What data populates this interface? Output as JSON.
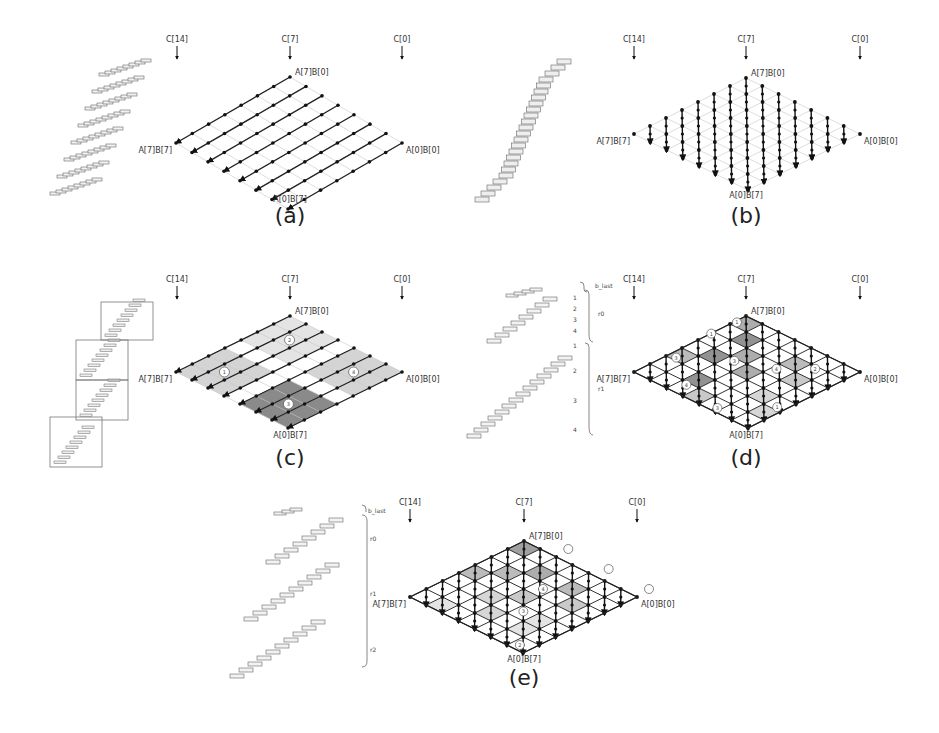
{
  "figure": {
    "panels": [
      {
        "id": "a",
        "caption": "(a)",
        "column_labels": [
          "C[14]",
          "C[7]",
          "C[0]"
        ],
        "corner_labels": {
          "top": "A[7]B[0]",
          "left": "A[7]B[7]",
          "right": "A[0]B[0]",
          "bottom": "A[0]B[7]"
        },
        "grid": {
          "top": [
            290,
            77
          ],
          "left": [
            176,
            143
          ],
          "right": [
            402,
            143
          ],
          "bottom": [
            290,
            192
          ]
        },
        "col_x": [
          177,
          290,
          402
        ],
        "col_y": 42,
        "flow": "row",
        "staircase": {
          "type": "rows",
          "x0": 50,
          "y0": 190,
          "rows": 8
        },
        "shaded": [],
        "circles": []
      },
      {
        "id": "b",
        "caption": "(b)",
        "column_labels": [
          "C[14]",
          "C[7]",
          "C[0]"
        ],
        "corner_labels": {
          "top": "A[7]B[0]",
          "left": "A[7]B[7]",
          "right": "A[0]B[0]",
          "bottom": "A[0]B[7]"
        },
        "grid": {
          "top": [
            746,
            78
          ],
          "left": [
            634,
            134
          ],
          "right": [
            860,
            134
          ],
          "bottom": [
            746,
            188
          ]
        },
        "col_x": [
          634,
          746,
          860
        ],
        "col_y": 42,
        "flow": "column",
        "staircase": {
          "type": "tower",
          "x0": 475,
          "y0": 197
        },
        "shaded": [],
        "circles": []
      },
      {
        "id": "c",
        "caption": "(c)",
        "column_labels": [
          "C[14]",
          "C[7]",
          "C[0]"
        ],
        "corner_labels": {
          "top": "A[7]B[0]",
          "left": "A[7]B[7]",
          "right": "A[0]B[0]",
          "bottom": "A[0]B[7]"
        },
        "grid": {
          "top": [
            290,
            316
          ],
          "left": [
            176,
            372
          ],
          "right": [
            402,
            372
          ],
          "bottom": [
            290,
            428
          ]
        },
        "col_x": [
          177,
          290,
          402
        ],
        "col_y": 282,
        "flow": "row-blocks",
        "staircase": {
          "type": "boxed",
          "boxes": 4
        },
        "shaded": [
          {
            "r0": 0,
            "r1": 3,
            "c0": 0,
            "c1": 3,
            "shade": "#e4e4e4"
          },
          {
            "r0": 4,
            "r1": 7,
            "c0": 0,
            "c1": 3,
            "shade": "#d4d4d4"
          },
          {
            "r0": 0,
            "r1": 3,
            "c0": 4,
            "c1": 7,
            "shade": "#d4d4d4"
          },
          {
            "r0": 4,
            "r1": 7,
            "c0": 4,
            "c1": 7,
            "shade": "#8a8a8a"
          }
        ],
        "circles": [
          {
            "label": "1",
            "r": 1.5,
            "c": 5.5
          },
          {
            "label": "2",
            "r": 5.5,
            "c": 1.5
          },
          {
            "label": "3",
            "r": 5.5,
            "c": 5.5
          },
          {
            "label": "4",
            "r": 1.5,
            "c": 5.5,
            "alt": true
          }
        ]
      },
      {
        "id": "d",
        "caption": "(d)",
        "column_labels": [
          "C[14]",
          "C[7]",
          "C[0]"
        ],
        "corner_labels": {
          "top": "A[7]B[0]",
          "left": "A[7]B[7]",
          "right": "A[0]B[0]",
          "bottom": "A[0]B[7]"
        },
        "grid": {
          "top": [
            746,
            316
          ],
          "left": [
            634,
            372
          ],
          "right": [
            860,
            372
          ],
          "bottom": [
            746,
            428
          ]
        },
        "col_x": [
          634,
          746,
          860
        ],
        "col_y": 282,
        "flow": "column",
        "staircase": {
          "type": "brackets"
        },
        "brackets": {
          "outer": [
            "b_last",
            "r_0",
            "r_1"
          ],
          "inner": [
            "1",
            "2",
            "3",
            "4",
            "1",
            "2",
            "3",
            "4"
          ]
        },
        "circles": [
          "1",
          "2",
          "3",
          "4",
          "5",
          "r_0",
          "r_1",
          "r_2",
          "b_last"
        ]
      },
      {
        "id": "e",
        "caption": "(e)",
        "column_labels": [
          "C[14]",
          "C[7]",
          "C[0]"
        ],
        "corner_labels": {
          "top": "A[7]B[0]",
          "left": "A[7]B[7]",
          "right": "A[0]B[0]",
          "bottom": "A[0]B[7]"
        },
        "grid": {
          "top": [
            524,
            541
          ],
          "left": [
            410,
            597
          ],
          "right": [
            637,
            597
          ],
          "bottom": [
            524,
            652
          ]
        },
        "col_x": [
          410,
          524,
          637
        ],
        "col_y": 505,
        "flow": "column",
        "staircase": {
          "type": "brackets"
        },
        "brackets": {
          "outer": [
            "b_last",
            "r_0",
            "r_1",
            "r_2"
          ]
        },
        "circles": [
          "1",
          "2",
          "3",
          "r_0",
          "r_1",
          "r_2",
          "b_last"
        ]
      }
    ]
  }
}
